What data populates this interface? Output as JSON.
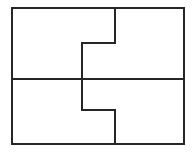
{
  "figure": {
    "background_color": "#ffffff",
    "stroke_color": "#262626",
    "stroke_width": 2,
    "canvas": {
      "width": 196,
      "height": 159
    },
    "bounds": {
      "left": 12,
      "top": 8,
      "right": 184,
      "bottom": 144
    },
    "guides": {
      "midline_y": 79,
      "upper_step_y": 43,
      "lower_step_y": 110,
      "right_divider_x": 115,
      "left_divider_x": 82
    },
    "shapes": {
      "outer_rectangle": {
        "name": "outer-rectangle",
        "points": "12,8 184,8 184,144 12,144 12,8"
      },
      "midline": {
        "name": "horizontal-midline",
        "points": "12,79 184,79"
      },
      "upper_step": {
        "name": "upper-step-divider",
        "points": "115,8 115,43 82,43 82,79"
      },
      "lower_step": {
        "name": "lower-step-divider",
        "points": "82,79 82,110 115,110 115,144"
      }
    },
    "regions": [
      {
        "id": "top-left",
        "label": ""
      },
      {
        "id": "top-right",
        "label": ""
      },
      {
        "id": "bottom-left",
        "label": ""
      },
      {
        "id": "bottom-right",
        "label": ""
      }
    ]
  }
}
